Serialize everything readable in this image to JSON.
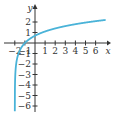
{
  "chart_data": {
    "type": "line",
    "title": "",
    "function": "y = ln(x + 2)",
    "xlabel": "x",
    "ylabel": "y",
    "xlim": [
      -2.5,
      7
    ],
    "ylim": [
      -7,
      2.8
    ],
    "grid": false,
    "legend": null,
    "x_ticks": [
      -2,
      -1,
      1,
      2,
      3,
      4,
      5,
      6
    ],
    "x_tick_labels": [
      "-2",
      "-1",
      "1",
      "2",
      "3",
      "4",
      "5",
      "6"
    ],
    "y_ticks": [
      2,
      1,
      -1,
      -2,
      -3,
      -4,
      -5,
      -6
    ],
    "y_tick_labels": [
      "2",
      "1",
      "-1",
      "-2",
      "-3",
      "-4",
      "-5",
      "-6"
    ],
    "series": [
      {
        "name": "curve",
        "color": "#4ab3d8",
        "x": [
          -1.999,
          -1.99,
          -1.95,
          -1.9,
          -1.8,
          -1.6,
          -1.4,
          -1.2,
          -1,
          -0.5,
          0,
          0.5,
          1,
          2,
          3,
          4,
          5,
          6,
          7
        ],
        "y": [
          -6.9,
          -4.6,
          -3.0,
          -2.3,
          -1.61,
          -0.92,
          -0.51,
          -0.22,
          0,
          0.41,
          0.69,
          0.92,
          1.1,
          1.39,
          1.61,
          1.79,
          1.95,
          2.08,
          2.2
        ]
      }
    ],
    "annotations": {
      "vertical_asymptote": -2,
      "x_intercept": -1,
      "y_intercept": 0.69
    }
  },
  "colors": {
    "curve": "#4ab3d8",
    "axes": "#333333"
  }
}
